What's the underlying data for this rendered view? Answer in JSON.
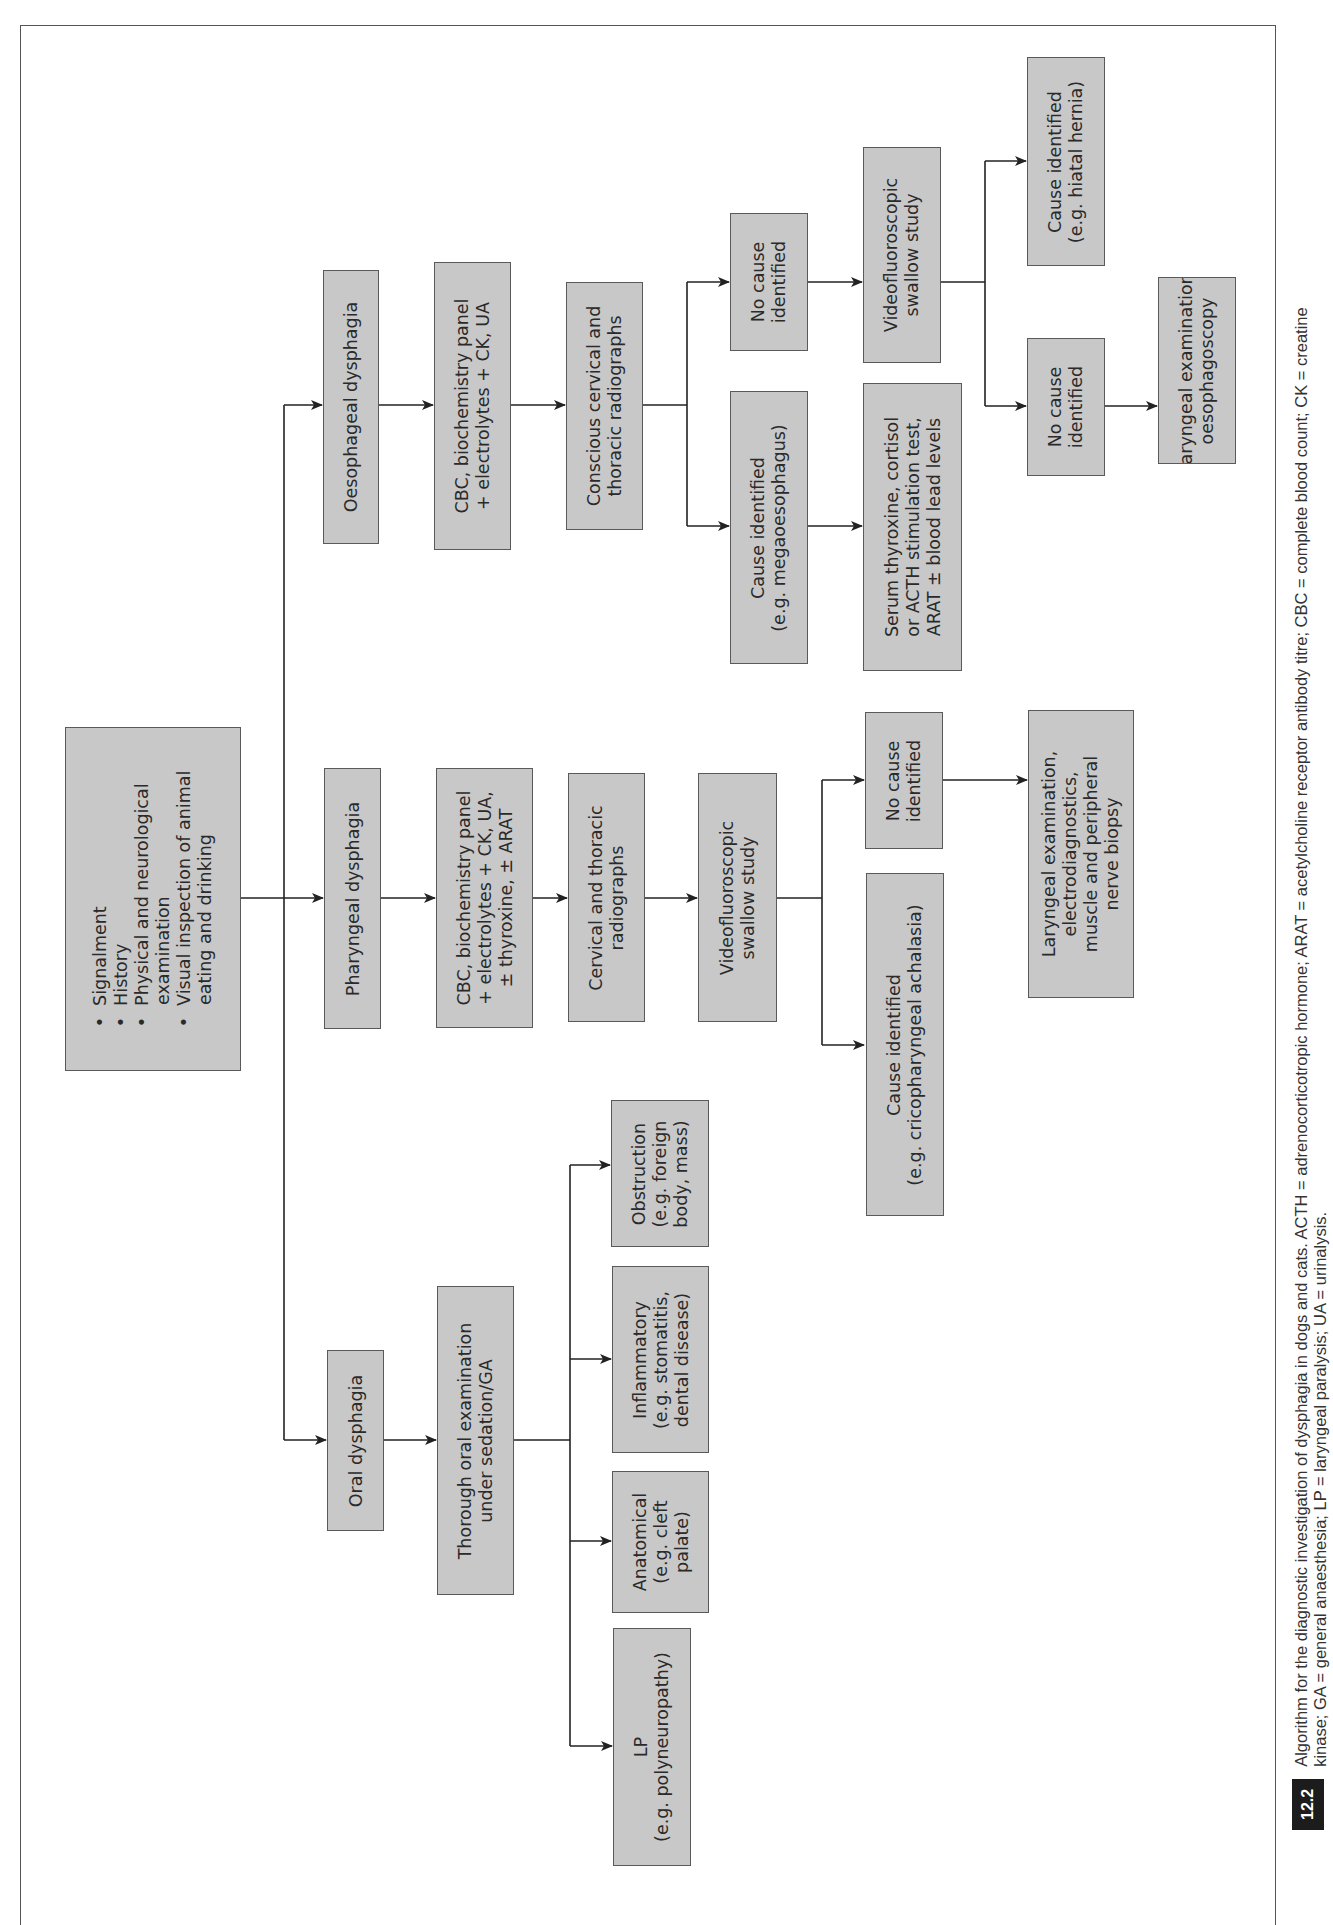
{
  "figure": {
    "number": "12.2",
    "caption_line1": "Algorithm for the diagnostic investigation of dysphagia in dogs and cats. ACTH = adrenocorticotropic hormone; ARAT = acetylcholine receptor antibody titre; CBC = complete blood count; CK = creatine",
    "caption_line2": "kinase; GA = general anaesthesia; LP = laryngeal paralysis; UA = urinalysis."
  },
  "start": {
    "items": [
      "•  Signalment",
      "•  History",
      "•  Physical and neurological\n    examination",
      "•  Visual inspection of animal\n    eating and drinking"
    ],
    "text": "•  Signalment\n•  History\n•  Physical and neurological\n    examination\n•  Visual inspection of animal\n    eating and drinking"
  },
  "oesophageal": {
    "title": "Oesophageal dysphagia",
    "bloods": "CBC, biochemistry panel\n+ electrolytes + CK, UA",
    "radiographs": "Conscious cervical and\nthoracic radiographs",
    "cause_identified": "Cause identified\n(e.g. megaoesophagus)",
    "cause_followup": "Serum thyroxine, cortisol\nor ACTH stimulation test,\nARAT ± blood lead levels",
    "no_cause": "No cause\nidentified",
    "vfss": "Videofluoroscopic\nswallow study",
    "vfss_cause": "Cause identified\n(e.g. hiatal hernia)",
    "vfss_no_cause": "No cause\nidentified",
    "final": "Laryngeal examination,\noesophagoscopy"
  },
  "pharyngeal": {
    "title": "Pharyngeal dysphagia",
    "bloods": "CBC, biochemistry panel\n+ electrolytes + CK, UA,\n± thyroxine, ± ARAT",
    "radiographs": "Cervical and thoracic\nradiographs",
    "vfss": "Videofluoroscopic\nswallow study",
    "cause_identified": "Cause identified\n(e.g. cricopharyngeal achalasia)",
    "no_cause": "No cause\nidentified",
    "final": "Laryngeal examination,\nelectrodiagnostics,\nmuscle and peripheral\nnerve biopsy"
  },
  "oral": {
    "title": "Oral dysphagia",
    "exam": "Thorough oral examination\nunder sedation/GA",
    "outcomes": [
      "Obstruction\n(e.g. foreign\nbody, mass)",
      "Inflammatory\n(e.g. stomatitis,\ndental disease)",
      "Anatomical\n(e.g. cleft\npalate)",
      "LP\n(e.g. polyneuropathy)"
    ]
  },
  "colors": {
    "box_fill": "#c8c8c8",
    "box_border": "#5a5a5a",
    "line": "#222222",
    "badge": "#1c1c1c"
  }
}
